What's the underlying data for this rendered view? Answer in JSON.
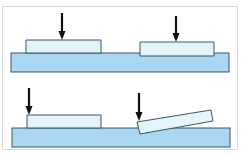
{
  "diagram": {
    "colors": {
      "base_fill": "#a9d6f0",
      "block_fill": "#e3f4fb",
      "outline": "#3a5668",
      "arrow": "#111111",
      "frame": "#d8d8d8",
      "background": "#ffffff"
    },
    "panels": [
      {
        "id": "top",
        "base": {
          "x": 11,
          "y": 53,
          "w": 218,
          "h": 19
        },
        "blocks": [
          {
            "id": "top-left-block",
            "points": "26,40 101,40 101,53 26,53",
            "state": "flat"
          },
          {
            "id": "top-right-block",
            "points": "140,42 214,42 214,56 140,56",
            "state": "flat"
          }
        ],
        "arrows": [
          {
            "id": "top-left-arrow",
            "x": 62,
            "y1": 13,
            "y2": 40
          },
          {
            "id": "top-right-arrow",
            "x": 176,
            "y1": 16,
            "y2": 42
          }
        ]
      },
      {
        "id": "bottom",
        "base": {
          "x": 12,
          "y": 128,
          "w": 218,
          "h": 19
        },
        "blocks": [
          {
            "id": "bottom-left-block",
            "points": "27,115 101,115 101,128 27,128",
            "state": "flat"
          },
          {
            "id": "bottom-right-block",
            "points": "137,122 211,110 213,121 140,134",
            "state": "tilted"
          }
        ],
        "arrows": [
          {
            "id": "bottom-left-arrow",
            "x": 29,
            "y1": 88,
            "y2": 115
          },
          {
            "id": "bottom-right-arrow",
            "x": 139,
            "y1": 93,
            "y2": 121
          }
        ]
      }
    ]
  }
}
